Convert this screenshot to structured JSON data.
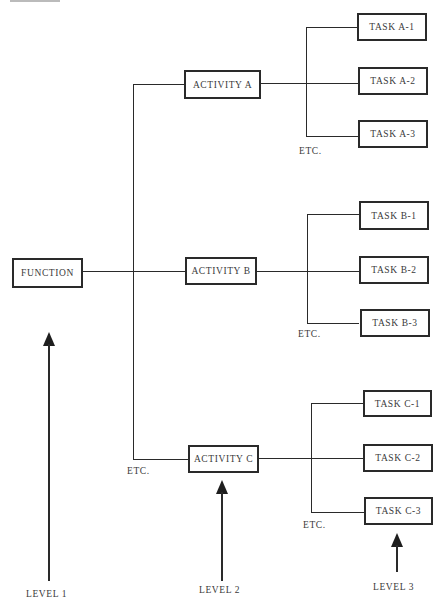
{
  "diagram": {
    "type": "hierarchy",
    "levels": [
      {
        "id": "level1",
        "label": "LEVEL 1"
      },
      {
        "id": "level2",
        "label": "LEVEL 2"
      },
      {
        "id": "level3",
        "label": "LEVEL 3"
      }
    ],
    "function": {
      "label": "FUNCTION"
    },
    "activities": [
      {
        "label": "ACTIVITY A",
        "tasks": [
          {
            "label": "TASK A-1"
          },
          {
            "label": "TASK A-2"
          },
          {
            "label": "TASK A-3"
          }
        ],
        "etc_label": "ETC."
      },
      {
        "label": "ACTIVITY B",
        "tasks": [
          {
            "label": "TASK B-1"
          },
          {
            "label": "TASK B-2"
          },
          {
            "label": "TASK B-3"
          }
        ],
        "etc_label": "ETC."
      },
      {
        "label": "ACTIVITY C",
        "tasks": [
          {
            "label": "TASK C-1"
          },
          {
            "label": "TASK C-2"
          },
          {
            "label": "TASK C-3"
          }
        ],
        "etc_label": "ETC."
      }
    ],
    "activities_etc_label": "ETC.",
    "colors": {
      "line": "#2a2a2a",
      "text": "#3a3a3a",
      "background": "#ffffff"
    }
  }
}
